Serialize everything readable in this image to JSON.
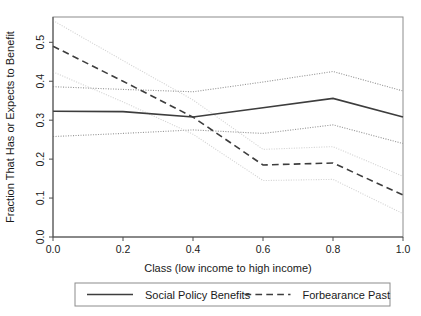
{
  "chart_data": {
    "type": "line",
    "title": "",
    "xlabel": "Class (low income to high income)",
    "ylabel": "Fraction That Has or Expects to Benefit",
    "x": [
      0.0,
      0.2,
      0.4,
      0.6,
      0.8,
      1.0
    ],
    "xlim": [
      0.0,
      1.0
    ],
    "ylim": [
      0.0,
      0.565
    ],
    "xticks": [
      0.0,
      0.2,
      0.4,
      0.6,
      0.8,
      1.0
    ],
    "xticklabels": [
      "0.0",
      "0.2",
      "0.4",
      "0.6",
      "0.8",
      "1.0"
    ],
    "yticks": [
      0.0,
      0.1,
      0.2,
      0.3,
      0.4,
      0.5
    ],
    "yticklabels": [
      "0.0",
      "0.1",
      "0.2",
      "0.3",
      "0.4",
      "0.5"
    ],
    "grid": false,
    "legend_position": "below-axes",
    "series": [
      {
        "name": "Social Policy Benefits",
        "role": "estimate",
        "style": "solid",
        "color": "#3d3d3d",
        "width": 1.6,
        "values": [
          0.323,
          0.322,
          0.308,
          0.332,
          0.356,
          0.308
        ]
      },
      {
        "name": "Social Policy Benefits upper CI",
        "role": "confidence-upper",
        "style": "dotted",
        "color": "#9a9a9a",
        "width": 1.1,
        "values": [
          0.386,
          0.379,
          0.373,
          0.398,
          0.425,
          0.375
        ]
      },
      {
        "name": "Social Policy Benefits lower CI",
        "role": "confidence-lower",
        "style": "dotted",
        "color": "#9a9a9a",
        "width": 1.1,
        "values": [
          0.258,
          0.266,
          0.275,
          0.266,
          0.288,
          0.24
        ]
      },
      {
        "name": "Forbearance Past",
        "role": "estimate",
        "style": "dashed",
        "color": "#3d3d3d",
        "width": 1.6,
        "values": [
          0.49,
          0.4,
          0.308,
          0.185,
          0.19,
          0.108
        ]
      },
      {
        "name": "Forbearance Past upper CI",
        "role": "confidence-upper",
        "style": "dotted",
        "color": "#d4d4d4",
        "width": 1.1,
        "values": [
          0.556,
          0.453,
          0.352,
          0.225,
          0.232,
          0.156
        ]
      },
      {
        "name": "Forbearance Past lower CI",
        "role": "confidence-lower",
        "style": "dotted",
        "color": "#d4d4d4",
        "width": 1.1,
        "values": [
          0.424,
          0.347,
          0.264,
          0.145,
          0.148,
          0.06
        ]
      }
    ],
    "legend": [
      {
        "label": "Social Policy Benefits",
        "style": "solid",
        "color": "#3d3d3d"
      },
      {
        "label": "Forbearance Past",
        "style": "dashed",
        "color": "#3d3d3d"
      }
    ]
  },
  "layout": {
    "plot": {
      "left": 53,
      "right": 403,
      "top": 17,
      "bottom": 237
    },
    "legend": {
      "left": 75,
      "right": 390,
      "top": 283,
      "bottom": 306
    }
  }
}
